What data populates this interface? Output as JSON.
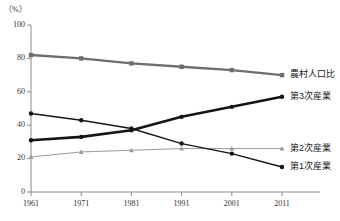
{
  "chart_data": {
    "type": "line",
    "title": "",
    "subtitle": "",
    "xlabel": "",
    "ylabel": "",
    "unit_label": "（%）",
    "x": [
      1961,
      1971,
      1981,
      1991,
      2001,
      2011
    ],
    "categories": [
      "1961",
      "1971",
      "1981",
      "1991",
      "2001",
      "2011"
    ],
    "ylim": [
      0,
      100
    ],
    "yticks": [
      0,
      20,
      40,
      60,
      80,
      100
    ],
    "ytick_labels": [
      "0",
      "20",
      "40",
      "60",
      "80",
      "100"
    ],
    "xtick_labels": [
      "1961",
      "1971",
      "1981",
      "1991",
      "2001",
      "2011"
    ],
    "grid": false,
    "legend_position": "right-inline",
    "series": [
      {
        "name": "農村人口比",
        "label": "農村人口比",
        "color": "#6e6e6e",
        "marker": "square",
        "stroke_width": 2.4,
        "values": [
          82,
          80,
          77,
          75,
          73,
          70
        ]
      },
      {
        "name": "第3次産業",
        "label": "第3次産業",
        "color": "#151515",
        "marker": "circle",
        "stroke_width": 2.6,
        "values": [
          31,
          33,
          37,
          45,
          51,
          57
        ]
      },
      {
        "name": "第2次産業",
        "label": "第2次産業",
        "color": "#9a9a9a",
        "marker": "triangle",
        "stroke_width": 1.0,
        "values": [
          21,
          24,
          25,
          26,
          26,
          26
        ]
      },
      {
        "name": "第1次産業",
        "label": "第1次産業",
        "color": "#151515",
        "marker": "circle",
        "stroke_width": 1.4,
        "values": [
          47,
          43,
          38,
          29,
          23,
          15
        ]
      }
    ]
  },
  "axis": {
    "axis_color": "#8a8a8a",
    "label_color": "#333333"
  }
}
